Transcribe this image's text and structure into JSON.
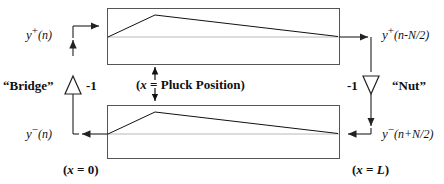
{
  "diagram": {
    "colors": {
      "line": "#333333",
      "box_border": "#555555",
      "wave": "#111111",
      "text": "#111111",
      "background": "#ffffff"
    },
    "labels": {
      "top_left_signal": {
        "base": "y",
        "sup": "+",
        "arg": "(n)"
      },
      "top_right_signal": {
        "base": "y",
        "sup": "+",
        "arg": "(n-N/2)"
      },
      "bottom_left_signal": {
        "base": "y",
        "sup": "−",
        "arg": "(n)"
      },
      "bottom_right_signal": {
        "base": "y",
        "sup": "−",
        "arg": "(n+N/2)"
      },
      "bridge": "“Bridge”",
      "nut": "“Nut”",
      "bridge_gain": "-1",
      "nut_gain": "-1",
      "pluck_position": "(x =  Pluck Position)",
      "pluck_position_var": "x",
      "pluck_position_rest": " =  Pluck Position)",
      "x_zero": "(x = 0)",
      "x_zero_var": "x",
      "x_zero_rest": " = 0)",
      "x_length": "(x = L)",
      "x_length_var": "x",
      "x_length_rest": " = ",
      "x_length_L": "L",
      "x_length_close": ")"
    },
    "elements": {
      "upper_delay_line": "upper-delay-line-box",
      "lower_delay_line": "lower-delay-line-box",
      "upper_wave": "upper-triangular-wave",
      "lower_wave": "lower-triangular-wave",
      "bridge_amplifier": "bridge-inverting-amplifier",
      "nut_amplifier": "nut-inverting-amplifier",
      "pluck_arrow_up": "pluck-arrow-up",
      "pluck_arrow_down": "pluck-arrow-down"
    }
  }
}
